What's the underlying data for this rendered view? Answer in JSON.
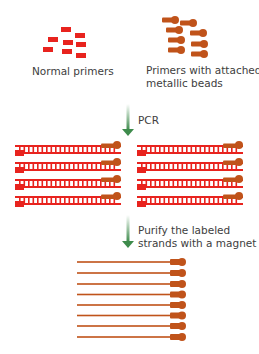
{
  "colors": {
    "primer_red": "#e8231e",
    "bead_brown": "#c0531a",
    "arrow_green_top": "#ffffff",
    "arrow_green_bottom": "#3e8b4c",
    "text": "#404040"
  },
  "top": {
    "normal_primers": {
      "label": "Normal primers",
      "count": 8
    },
    "bead_primers": {
      "label_line1": "Primers with attached",
      "label_line2": "metallic beads",
      "count": 8
    }
  },
  "steps": [
    {
      "arrow": "down-arrow",
      "label": "PCR"
    },
    {
      "arrow": "down-arrow",
      "label_line1": "Purify the labeled",
      "label_line2": "strands with a magnet"
    }
  ],
  "pcr_products": {
    "columns": 2,
    "rows_per_column": 4
  },
  "purified_strands": {
    "count": 8
  }
}
